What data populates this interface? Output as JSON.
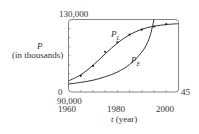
{
  "chart_data": {
    "type": "line",
    "title": "",
    "xlabel": "t (year)",
    "ylabel": "P (in thousands)",
    "xlim": [
      0,
      45
    ],
    "ylim": [
      90000,
      130000
    ],
    "x_tick_labels": [
      "1960",
      "1980",
      "2000"
    ],
    "x_tick_label_positions": [
      0,
      20,
      40
    ],
    "x_minor_ticks_every": 5,
    "corner_labels": {
      "y_top": "130,000",
      "y_bottom": "90,000",
      "x_left": "0",
      "x_right": "45"
    },
    "grid": false,
    "legend": "inline curve labels",
    "series": [
      {
        "name": "data",
        "kind": "scatter",
        "x": [
          5,
          10,
          15,
          20,
          25,
          30,
          35,
          40
        ],
        "years": [
          1965,
          1970,
          1975,
          1980,
          1985,
          1990,
          1995,
          2000
        ],
        "values": [
          98900,
          104400,
          112200,
          117400,
          121700,
          124400,
          126100,
          127400
        ]
      },
      {
        "name": "P_L",
        "label": "P",
        "subscript": "L",
        "kind": "logistic",
        "x": [
          0,
          5,
          10,
          15,
          20,
          25,
          30,
          35,
          40,
          45
        ],
        "values": [
          96100,
          99500,
          104700,
          111000,
          117000,
          121600,
          124600,
          126300,
          127200,
          127700
        ]
      },
      {
        "name": "P_E",
        "label": "P",
        "subscript": "E",
        "kind": "exponential",
        "x": [
          0,
          5,
          10,
          15,
          20,
          25,
          30,
          33,
          35
        ],
        "values": [
          94400,
          95300,
          96500,
          98400,
          101000,
          105200,
          112000,
          119500,
          130000
        ]
      }
    ]
  },
  "labels": {
    "y_top": "130,000",
    "y_axis_var": "P",
    "y_axis_unit": "(in thousands)",
    "zero": "0",
    "right_max": "45",
    "y_bottom": "90,000",
    "x_ticks": [
      "1960",
      "1980",
      "2000"
    ],
    "x_axis_var": "t",
    "x_axis_unit": "(year)",
    "curve_L": "P",
    "curve_L_sub": "L",
    "curve_E": "P",
    "curve_E_sub": "E"
  }
}
